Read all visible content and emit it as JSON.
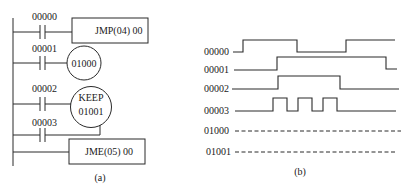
{
  "ladder": {
    "caption": "(a)",
    "rungs": [
      {
        "contact": "00000",
        "output_type": "box",
        "output_label": "JMP(04) 00"
      },
      {
        "contact": "00001",
        "output_type": "coil",
        "output_label": "01000"
      },
      {
        "contact": "00002",
        "output_type": "keep",
        "output_label_top": "KEEP",
        "output_label_bottom": "01001",
        "note": "set input"
      },
      {
        "contact": "00003",
        "output_type": "keep-reset",
        "note": "reset input to KEEP 01001"
      },
      {
        "contact": "",
        "output_type": "box",
        "output_label": "JME(05) 00"
      }
    ]
  },
  "timing": {
    "caption": "(b)",
    "signals": [
      {
        "name": "00000",
        "style": "solid",
        "pattern": "low-high-low-high"
      },
      {
        "name": "00001",
        "style": "solid",
        "pattern": "low-high-low"
      },
      {
        "name": "00002",
        "style": "solid",
        "pattern": "low-high-low"
      },
      {
        "name": "00003",
        "style": "solid",
        "pattern": "low-3 pulses-low"
      },
      {
        "name": "01000",
        "style": "dashed",
        "pattern": "undetermined"
      },
      {
        "name": "01001",
        "style": "dashed",
        "pattern": "undetermined"
      }
    ]
  }
}
